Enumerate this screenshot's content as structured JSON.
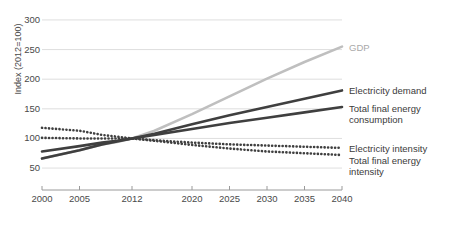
{
  "chart_data": {
    "type": "line",
    "title": "",
    "xlabel": "",
    "ylabel": "Index (2012=100)",
    "xlim": [
      2000,
      2040
    ],
    "ylim": [
      40,
      310
    ],
    "grid": true,
    "legend_position": "right-inline",
    "x_ticks": [
      "2000",
      "2005",
      "2012",
      "2020",
      "2025",
      "2030",
      "2035",
      "2040"
    ],
    "x_tick_values": [
      2000,
      2005,
      2012,
      2020,
      2025,
      2030,
      2035,
      2040
    ],
    "y_ticks": [
      "50",
      "100",
      "150",
      "200",
      "250",
      "300"
    ],
    "y_tick_values": [
      50,
      100,
      150,
      200,
      250,
      300
    ],
    "x": [
      2000,
      2005,
      2008,
      2010,
      2012,
      2015,
      2020,
      2025,
      2030,
      2035,
      2040
    ],
    "series": [
      {
        "name": "GDP",
        "color": "#bfbfbf",
        "style": "solid",
        "width": 2.6,
        "values": [
          66,
          80,
          90,
          94,
          100,
          113,
          141,
          171,
          201,
          229,
          255
        ]
      },
      {
        "name": "Electricity demand",
        "color": "#3f3f3f",
        "style": "solid",
        "width": 2.6,
        "values": [
          78,
          87,
          93,
          96,
          100,
          108,
          124,
          139,
          153,
          167,
          181
        ]
      },
      {
        "name": "Total final energy consumption",
        "color": "#3f3f3f",
        "style": "solid",
        "width": 2.6,
        "values": [
          66,
          80,
          90,
          95,
          100,
          106,
          116,
          126,
          135,
          144,
          153
        ]
      },
      {
        "name": "Electricity intensity",
        "color": "#3f3f3f",
        "style": "dotted",
        "width": 2.6,
        "values": [
          118,
          113,
          106,
          103,
          100,
          97,
          93,
          90,
          88,
          86,
          84
        ]
      },
      {
        "name": "Total final energy intensity",
        "color": "#3f3f3f",
        "style": "dotted",
        "width": 2.6,
        "values": [
          101,
          100,
          100,
          100,
          100,
          96,
          89,
          83,
          78,
          75,
          72
        ]
      }
    ],
    "inline_labels": [
      {
        "text": "GDP",
        "value_at_2040": 255,
        "muted": true
      },
      {
        "text": "Electricity demand",
        "value_at_2040": 181,
        "muted": false
      },
      {
        "text": "Total final energy\nconsumption",
        "value_at_2040": 153,
        "muted": false
      },
      {
        "text": "Electricity intensity",
        "value_at_2040": 84,
        "muted": false
      },
      {
        "text": "Total final energy\nintensity",
        "value_at_2040": 72,
        "muted": false
      }
    ]
  }
}
